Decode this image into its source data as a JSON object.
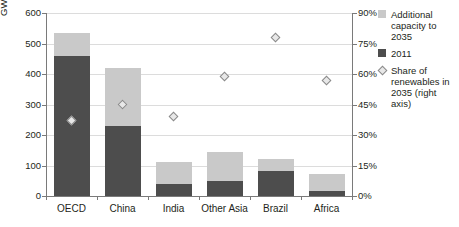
{
  "chart_data": {
    "type": "bar",
    "title": "",
    "subtitle": "",
    "xlabel": "",
    "ylabel": "GW",
    "ylabel_right": "",
    "categories": [
      "OECD",
      "China",
      "India",
      "Other Asia",
      "Brazil",
      "Africa"
    ],
    "series": [
      {
        "name": "2011",
        "key": "base",
        "axis": "left",
        "unit": "GW",
        "color": "#4d4d4d",
        "values": [
          460,
          230,
          40,
          48,
          82,
          18
        ]
      },
      {
        "name": "Additional capacity to 2035",
        "key": "additional",
        "axis": "left",
        "unit": "GW",
        "color": "#c9c9c9",
        "values": [
          75,
          190,
          70,
          97,
          41,
          54
        ]
      },
      {
        "name": "Share of renewables in 2035 (right axis)",
        "key": "share",
        "axis": "right",
        "unit": "%",
        "marker": "diamond",
        "color": "#8a8a8a",
        "values": [
          37,
          45,
          39,
          59,
          78,
          57
        ]
      }
    ],
    "totals_gw": [
      535,
      420,
      110,
      145,
      123,
      72
    ],
    "stacked": true,
    "ylim": [
      0,
      600
    ],
    "yticks": [
      0,
      100,
      200,
      300,
      400,
      500,
      600
    ],
    "ytick_labels": [
      "0",
      "100",
      "200",
      "300",
      "400",
      "500",
      "600"
    ],
    "ylim_right": [
      0,
      90
    ],
    "yticks_right": [
      0,
      15,
      30,
      45,
      60,
      75,
      90
    ],
    "ytick_labels_right": [
      "0%",
      "15%",
      "30%",
      "45%",
      "60%",
      "75%",
      "90%"
    ],
    "grid": true,
    "grid_axis": "y",
    "legend_position": "right"
  },
  "legend": {
    "items": [
      {
        "label": "Additional capacity to 2035",
        "marker": "square-light"
      },
      {
        "label": "2011",
        "marker": "square-dark"
      },
      {
        "label": "Share of renewables in 2035 (right axis)",
        "marker": "diamond-outline"
      }
    ]
  },
  "colors": {
    "additional_capacity": "#c9c9c9",
    "base_2011": "#4d4d4d",
    "share_marker_fill": "#e8e8e8",
    "share_marker_stroke": "#8a8a8a",
    "gridline": "#dcdcdc",
    "axis": "#7a7a7a",
    "text": "#231f20",
    "background": "#ffffff"
  }
}
